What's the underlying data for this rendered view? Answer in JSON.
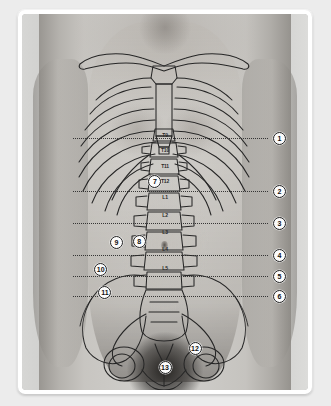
{
  "figure": {
    "subject_view": "anterior",
    "frame_color": "#ffffff",
    "background_color": "#ececec",
    "line_color": "#2b2b2b",
    "callout_fill": "#fbfbfb",
    "callout_text_color": "#111111"
  },
  "reference_lines": [
    {
      "id": "line-1",
      "number": "1",
      "y_pct": 33.0,
      "x_start_pct": 18.0,
      "x_end_pct": 86.0
    },
    {
      "id": "line-2",
      "number": "2",
      "y_pct": 47.2,
      "x_start_pct": 18.0,
      "x_end_pct": 86.0
    },
    {
      "id": "line-3",
      "number": "3",
      "y_pct": 55.6,
      "x_start_pct": 18.0,
      "x_end_pct": 86.0
    },
    {
      "id": "line-4",
      "number": "4",
      "y_pct": 64.2,
      "x_start_pct": 18.0,
      "x_end_pct": 86.0
    },
    {
      "id": "line-5",
      "number": "5",
      "y_pct": 69.8,
      "x_start_pct": 18.0,
      "x_end_pct": 86.0
    },
    {
      "id": "line-6",
      "number": "6",
      "y_pct": 75.0,
      "x_start_pct": 18.0,
      "x_end_pct": 86.0
    }
  ],
  "callouts": [
    {
      "id": "callout-1",
      "number": "1",
      "x_pct": 90.0,
      "y_pct": 33.0
    },
    {
      "id": "callout-2",
      "number": "2",
      "x_pct": 90.0,
      "y_pct": 47.2
    },
    {
      "id": "callout-3",
      "number": "3",
      "x_pct": 90.0,
      "y_pct": 55.6
    },
    {
      "id": "callout-4",
      "number": "4",
      "x_pct": 90.0,
      "y_pct": 64.2
    },
    {
      "id": "callout-5",
      "number": "5",
      "x_pct": 90.0,
      "y_pct": 69.8
    },
    {
      "id": "callout-6",
      "number": "6",
      "x_pct": 90.0,
      "y_pct": 75.0
    },
    {
      "id": "callout-7",
      "number": "7",
      "x_pct": 46.5,
      "y_pct": 44.5
    },
    {
      "id": "callout-8",
      "number": "8",
      "x_pct": 41.0,
      "y_pct": 60.5
    },
    {
      "id": "callout-9",
      "number": "9",
      "x_pct": 33.0,
      "y_pct": 60.8
    },
    {
      "id": "callout-10",
      "number": "10",
      "x_pct": 27.5,
      "y_pct": 68.0
    },
    {
      "id": "callout-11",
      "number": "11",
      "x_pct": 29.0,
      "y_pct": 74.0
    },
    {
      "id": "callout-12",
      "number": "12",
      "x_pct": 60.5,
      "y_pct": 89.0
    },
    {
      "id": "callout-13",
      "number": "13",
      "x_pct": 50.0,
      "y_pct": 94.0
    }
  ],
  "vertebra_labels": [
    {
      "id": "vertebra-t9",
      "text": "T9",
      "x_pct": 50.0,
      "y_pct": 32.3
    },
    {
      "id": "vertebra-t10",
      "text": "T10",
      "x_pct": 50.0,
      "y_pct": 36.3
    },
    {
      "id": "vertebra-t11",
      "text": "T11",
      "x_pct": 50.0,
      "y_pct": 40.4
    },
    {
      "id": "vertebra-t12",
      "text": "T12",
      "x_pct": 50.0,
      "y_pct": 44.4
    },
    {
      "id": "vertebra-l1",
      "text": "L1",
      "x_pct": 50.0,
      "y_pct": 48.6
    },
    {
      "id": "vertebra-l2",
      "text": "L2",
      "x_pct": 50.0,
      "y_pct": 53.4
    },
    {
      "id": "vertebra-l3",
      "text": "L3",
      "x_pct": 50.0,
      "y_pct": 58.0
    },
    {
      "id": "vertebra-l4",
      "text": "L4",
      "x_pct": 50.0,
      "y_pct": 62.6
    },
    {
      "id": "vertebra-l5",
      "text": "L5",
      "x_pct": 50.0,
      "y_pct": 67.6
    }
  ]
}
